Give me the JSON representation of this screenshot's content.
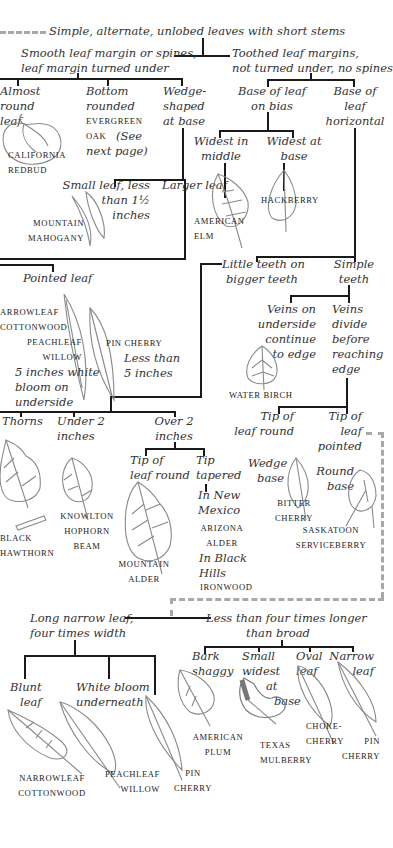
{
  "title": "Simple, alternate, unlobed leaves with short stems",
  "branches": {
    "smooth": "Smooth leaf margin or spines, leaf margin turned under",
    "smooth_l1": "Smooth leaf margin or spines,",
    "smooth_l2": "leaf margin turned under",
    "toothed_l1": "Toothed leaf margins,",
    "toothed_l2": "not turned under, no spines"
  },
  "smooth_group": {
    "almost_round": [
      "Almost",
      "round",
      "leaf"
    ],
    "bottom_rounded": [
      "Bottom",
      "rounded"
    ],
    "evergreen_oak": [
      "EVERGREEN",
      "OAK"
    ],
    "see_next": [
      "(See",
      "next page)"
    ],
    "wedge": [
      "Wedge-",
      "shaped",
      "at base"
    ],
    "small_leaf": [
      "Small leaf, less",
      "than 1½",
      "inches"
    ],
    "larger_leaf": "Larger leaf",
    "pointed_leaf": "Pointed leaf",
    "five_inches": [
      "5 inches white",
      "bloom on",
      "underside"
    ],
    "less_than_5": [
      "Less than",
      "5 inches"
    ],
    "thorns": "Thorns",
    "under_2": [
      "Under 2",
      "inches"
    ],
    "over_2": [
      "Over 2",
      "inches"
    ],
    "tip_round": [
      "Tip of",
      "leaf round"
    ],
    "tip_tapered": [
      "Tip",
      "tapered"
    ],
    "new_mexico": [
      "In New",
      "Mexico"
    ],
    "black_hills": [
      "In Black",
      "Hills"
    ]
  },
  "toothed_group": {
    "base_bias": [
      "Base of leaf",
      "on bias"
    ],
    "base_horizontal": [
      "Base of",
      "leaf",
      "horizontal"
    ],
    "widest_middle": [
      "Widest in",
      "middle"
    ],
    "widest_base": [
      "Widest at",
      "base"
    ],
    "little_teeth": [
      "Little teeth on",
      "bigger teeth"
    ],
    "simple_teeth": [
      "Simple",
      "teeth"
    ],
    "veins_continue": [
      "Veins on",
      "underside",
      "continue",
      "to edge"
    ],
    "veins_divide": [
      "Veins",
      "divide",
      "before",
      "reaching",
      "edge"
    ],
    "tip_round": [
      "Tip of",
      "leaf round"
    ],
    "tip_pointed": [
      "Tip of",
      "leaf",
      "pointed"
    ],
    "wedge_base": [
      "Wedge",
      "base"
    ],
    "round_base": [
      "Round",
      "base"
    ]
  },
  "lower_group": {
    "long_narrow": [
      "Long narrow leaf,",
      "four times width"
    ],
    "less_than_four": [
      "Less than four times longer",
      "than broad"
    ],
    "blunt_leaf": [
      "Blunt",
      "leaf"
    ],
    "white_bloom": [
      "White bloom",
      "underneath"
    ],
    "bark_shaggy": [
      "Bark",
      "shaggy"
    ],
    "small_widest": [
      "Small",
      "widest",
      "at",
      "base"
    ],
    "oval_leaf": [
      "Oval",
      "leaf"
    ],
    "narrow_leaf": [
      "Narrow",
      "leaf"
    ]
  },
  "species": {
    "california_redbud": [
      "CALIFORNIA",
      "REDBUD"
    ],
    "mountain_mahogany": [
      "MOUNTAIN",
      "MAHOGANY"
    ],
    "american_elm": [
      "AMERICAN",
      "ELM"
    ],
    "hackberry": "HACKBERRY",
    "arrowleaf_cottonwood": [
      "ARROWLEAF",
      "COTTONWOOD"
    ],
    "peachleaf_willow": [
      "PEACHLEAF",
      "WILLOW"
    ],
    "pin_cherry": "PIN CHERRY",
    "water_birch": "WATER BIRCH",
    "black_hawthorn": [
      "BLACK",
      "HAWTHORN"
    ],
    "knowlton_hophornbeam": [
      "KNOWLTON",
      "HOPHORN",
      "BEAM"
    ],
    "mountain_alder": [
      "MOUNTAIN",
      "ALDER"
    ],
    "arizona_alder": [
      "ARIZONA",
      "ALDER"
    ],
    "ironwood": "IRONWOOD",
    "bitter_cherry": [
      "BITTER",
      "CHERRY"
    ],
    "saskatoon_serviceberry": [
      "SASKATOON",
      "SERVICEBERRY"
    ],
    "american_plum": [
      "AMERICAN",
      "PLUM"
    ],
    "texas_mulberry": [
      "TEXAS",
      "MULBERRY"
    ],
    "choke_cherry": [
      "CHOKE-",
      "CHERRY"
    ],
    "pin_cherry_2": [
      "PIN",
      "CHERRY"
    ],
    "narrowleaf_cottonwood": [
      "NARROWLEAF",
      "COTTONWOOD"
    ],
    "peachleaf_willow_2": [
      "PEACHLEAF",
      "WILLOW"
    ],
    "pin_cherry_3": [
      "PIN",
      "CHERRY"
    ]
  }
}
